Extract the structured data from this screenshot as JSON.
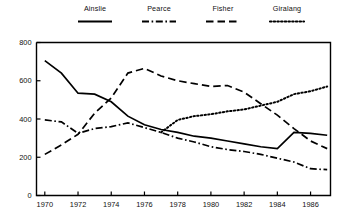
{
  "legend": {
    "position": "top",
    "entries": [
      {
        "label": "Ainslie",
        "style": "solid",
        "swatch_icon": "line-solid-icon"
      },
      {
        "label": "Pearce",
        "style": "dash-dot",
        "swatch_icon": "line-dashdot-icon"
      },
      {
        "label": "Fisher",
        "style": "dashed",
        "swatch_icon": "line-dashed-icon"
      },
      {
        "label": "Giralang",
        "style": "dotted",
        "swatch_icon": "line-dotted-icon"
      }
    ]
  },
  "axes": {
    "y_ticks": [
      "0",
      "200",
      "400",
      "600",
      "800"
    ],
    "x_ticks": [
      "1970",
      "1972",
      "1974",
      "1976",
      "1978",
      "1980",
      "1982",
      "1984",
      "1986"
    ]
  },
  "chart_data": {
    "type": "line",
    "title": "",
    "subtitle": "",
    "xlabel": "",
    "ylabel": "",
    "xlim": [
      1969.5,
      1987.2
    ],
    "ylim": [
      0,
      800
    ],
    "grid": false,
    "legend_position": "top",
    "y_ticks": [
      0,
      200,
      400,
      600,
      800
    ],
    "x_ticks": [
      1970,
      1972,
      1974,
      1976,
      1978,
      1980,
      1982,
      1984,
      1986
    ],
    "series": [
      {
        "name": "Ainslie",
        "style": "solid",
        "color": "#000000",
        "x": [
          1970,
          1971,
          1972,
          1973,
          1974,
          1975,
          1976,
          1977,
          1978,
          1979,
          1980,
          1981,
          1982,
          1983,
          1984,
          1985,
          1986,
          1987
        ],
        "values": [
          705,
          640,
          535,
          530,
          490,
          415,
          370,
          345,
          330,
          310,
          300,
          285,
          270,
          255,
          245,
          330,
          325,
          315
        ]
      },
      {
        "name": "Pearce",
        "style": "dash-dot",
        "color": "#000000",
        "x": [
          1970,
          1971,
          1972,
          1973,
          1974,
          1975,
          1976,
          1977,
          1978,
          1979,
          1980,
          1981,
          1982,
          1983,
          1984,
          1985,
          1986,
          1987
        ],
        "values": [
          395,
          385,
          325,
          350,
          360,
          380,
          355,
          330,
          300,
          280,
          255,
          240,
          230,
          215,
          195,
          175,
          140,
          135
        ]
      },
      {
        "name": "Fisher",
        "style": "dashed",
        "color": "#000000",
        "x": [
          1970,
          1971,
          1972,
          1973,
          1974,
          1975,
          1976,
          1977,
          1978,
          1979,
          1980,
          1981,
          1982,
          1983,
          1984,
          1985,
          1986,
          1987
        ],
        "values": [
          215,
          265,
          320,
          430,
          510,
          640,
          665,
          625,
          600,
          585,
          570,
          575,
          540,
          480,
          420,
          350,
          285,
          245
        ]
      },
      {
        "name": "Giralang",
        "style": "dotted",
        "color": "#000000",
        "x": [
          1977,
          1978,
          1979,
          1980,
          1981,
          1982,
          1983,
          1984,
          1985,
          1986,
          1987
        ],
        "values": [
          330,
          395,
          415,
          425,
          440,
          450,
          470,
          490,
          530,
          545,
          570
        ]
      }
    ]
  }
}
